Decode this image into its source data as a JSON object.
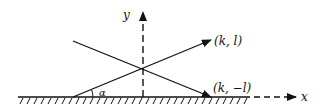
{
  "diagram": {
    "axes": {
      "x_label": "x",
      "y_label": "y"
    },
    "vectors": [
      {
        "label": "(k, l)",
        "direction": "up-right"
      },
      {
        "label": "(k, −l)",
        "direction": "down-right"
      }
    ],
    "angle_label": "α",
    "boundary": "hatched ground line"
  }
}
